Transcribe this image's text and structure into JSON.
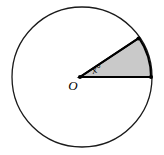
{
  "figure": {
    "background_color": "#ffffff",
    "stroke_color": "#1a1a1a",
    "sector_fill_color": "#c9c9c9",
    "sector_stroke_color": "#000000",
    "canvas": {
      "width": 164,
      "height": 155
    },
    "circle": {
      "center_x": 82,
      "center_y": 77,
      "radius": 70,
      "stroke_width": 1.3
    },
    "sector": {
      "vertex_x": 80,
      "vertex_y": 77,
      "radius": 71,
      "start_angle_deg": 0,
      "end_angle_deg": 33,
      "arc_endpoint_upper_x": 139,
      "arc_endpoint_upper_y": 38,
      "arc_endpoint_right_x": 151,
      "arc_endpoint_right_y": 77,
      "stroke_width": 2
    },
    "points": [
      {
        "name": "center-point",
        "x": 80,
        "y": 77,
        "size": 3.2
      },
      {
        "name": "arc-endpoint-upper",
        "x": 138.5,
        "y": 38.5,
        "size": 3.2
      },
      {
        "name": "arc-endpoint-right",
        "x": 151,
        "y": 77,
        "size": 3.2
      }
    ],
    "labels": {
      "center": {
        "text": "O",
        "x": 73,
        "y": 90,
        "font_size": 13
      },
      "angle": {
        "text": "x°",
        "x": 93,
        "y": 74,
        "font_size": 11,
        "rotation_deg": -18
      }
    }
  }
}
